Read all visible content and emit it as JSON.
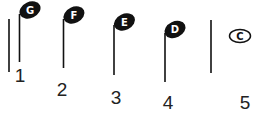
{
  "diagram": {
    "type": "music-notation-sequence",
    "notes": [
      {
        "number": "1",
        "letter": "G",
        "style": "filled-stem"
      },
      {
        "number": "2",
        "letter": "F",
        "style": "filled-stem"
      },
      {
        "number": "3",
        "letter": "E",
        "style": "filled-stem"
      },
      {
        "number": "4",
        "letter": "D",
        "style": "filled-stem"
      },
      {
        "number": "5",
        "letter": "C",
        "style": "hollow-whole"
      }
    ],
    "barlines": [
      "before-note-1",
      "between-note-4-and-5"
    ],
    "colors": {
      "ink": "#111111",
      "background": "#ffffff"
    }
  }
}
